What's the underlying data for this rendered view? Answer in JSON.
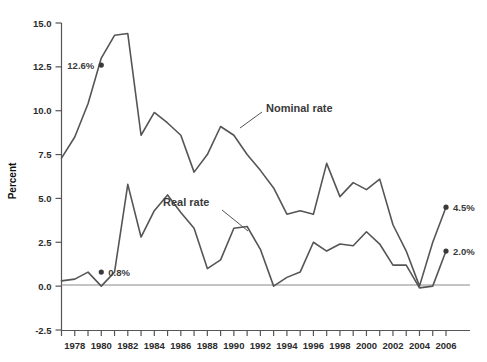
{
  "chart_data": {
    "type": "line",
    "title": "",
    "subtitle": "",
    "xlabel": "",
    "ylabel": "Percent",
    "grid": false,
    "legend_position": "inline-annotation",
    "xlim": [
      1977,
      2006
    ],
    "ylim": [
      -2.5,
      15.0
    ],
    "ytick_values": [
      -2.5,
      0.0,
      2.5,
      5.0,
      7.5,
      10.0,
      12.5,
      15.0
    ],
    "ytick_labels": [
      "-2.5",
      "0.0",
      "2.5",
      "5.0",
      "7.5",
      "10.0",
      "12.5",
      "15.0"
    ],
    "xtick_values": [
      1977,
      1978,
      1979,
      1980,
      1981,
      1982,
      1983,
      1984,
      1985,
      1986,
      1987,
      1988,
      1989,
      1990,
      1991,
      1992,
      1993,
      1994,
      1995,
      1996,
      1997,
      1998,
      1999,
      2000,
      2001,
      2002,
      2003,
      2004,
      2005,
      2006
    ],
    "xtick_labels_shown": [
      "1978",
      "1980",
      "1982",
      "1984",
      "1986",
      "1988",
      "1990",
      "1992",
      "1994",
      "1996",
      "1998",
      "2000",
      "2002",
      "2004",
      "2006"
    ],
    "x": [
      1977,
      1978,
      1979,
      1980,
      1981,
      1982,
      1983,
      1984,
      1985,
      1986,
      1987,
      1988,
      1989,
      1990,
      1991,
      1992,
      1993,
      1994,
      1995,
      1996,
      1997,
      1998,
      1999,
      2000,
      2001,
      2002,
      2003,
      2004,
      2005,
      2006
    ],
    "series": [
      {
        "name": "Nominal rate",
        "color": "#555555",
        "values": [
          7.3,
          8.5,
          10.4,
          13.0,
          14.3,
          14.4,
          8.6,
          9.9,
          9.3,
          8.6,
          6.5,
          7.5,
          9.1,
          8.6,
          7.5,
          6.6,
          5.6,
          4.1,
          4.3,
          4.1,
          7.0,
          5.1,
          5.9,
          5.5,
          6.1,
          3.5,
          2.0,
          0.0,
          2.5,
          4.5
        ]
      },
      {
        "name": "Real rate",
        "color": "#555555",
        "values": [
          0.3,
          0.4,
          0.8,
          0.0,
          0.8,
          5.8,
          2.8,
          4.3,
          5.2,
          4.2,
          3.3,
          1.0,
          1.5,
          3.3,
          3.4,
          2.1,
          0.0,
          0.5,
          0.8,
          2.5,
          2.0,
          2.4,
          2.3,
          3.1,
          2.4,
          1.2,
          1.2,
          -0.1,
          0.0,
          2.0
        ]
      }
    ],
    "annotations": [
      {
        "name": "12.6-percent",
        "text": "12.6%",
        "x": 1980,
        "y": 12.6,
        "label_side": "left",
        "marker": true
      },
      {
        "name": "0.8-percent",
        "text": "0.8%",
        "x": 1980,
        "y": 0.8,
        "label_side": "right",
        "marker": true
      },
      {
        "name": "4.5-percent",
        "text": "4.5%",
        "x": 2006,
        "y": 4.5,
        "label_side": "right",
        "marker": true
      },
      {
        "name": "2.0-percent",
        "text": "2.0%",
        "x": 2006,
        "y": 2.0,
        "label_side": "right",
        "marker": true
      }
    ],
    "series_callouts": [
      {
        "name": "nominal-rate-callout",
        "text": "Nominal rate",
        "leader_from": [
          286,
          108
        ],
        "leader_to": [
          240,
          128
        ]
      },
      {
        "name": "real-rate-callout",
        "text": "Real rate",
        "leader_from": [
          213,
          206
        ],
        "leader_to": [
          250,
          230
        ]
      }
    ]
  },
  "axis": {
    "y_title": "Percent",
    "ticks_y": [
      "15.0",
      "12.5",
      "10.0",
      "7.5",
      "5.0",
      "2.5",
      "0.0",
      "-2.5"
    ],
    "ticks_x": [
      "1978",
      "1980",
      "1982",
      "1984",
      "1986",
      "1988",
      "1990",
      "1992",
      "1994",
      "1996",
      "1998",
      "2000",
      "2002",
      "2004",
      "2006"
    ]
  },
  "labels": {
    "nominal": "Nominal rate",
    "real": "Real rate",
    "p1": "12.6%",
    "p2": "0.8%",
    "p3": "4.5%",
    "p4": "2.0%"
  },
  "colors": {
    "line": "#555555",
    "axis": "#555555",
    "zero_line": "#888888",
    "text": "#2b2b2b",
    "background": "#ffffff"
  }
}
